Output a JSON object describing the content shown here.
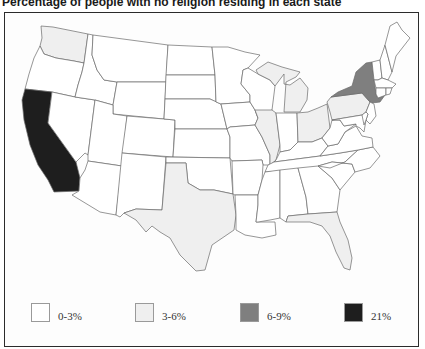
{
  "title": "Percentage of people with no religion residing in each state",
  "colors": {
    "c0": "#ffffff",
    "c1": "#efefef",
    "c2": "#7f7f7f",
    "c3": "#1e1e1e",
    "border": "#6a6a6a",
    "frame": "#2b2b2b"
  },
  "legend": {
    "items": [
      {
        "label": "0-3%",
        "class": "c0",
        "color": "#ffffff",
        "x": 31
      },
      {
        "label": "3-6%",
        "class": "c1",
        "color": "#efefef",
        "x": 135
      },
      {
        "label": "6-9%",
        "class": "c2",
        "color": "#7f7f7f",
        "x": 240
      },
      {
        "label": "21%",
        "class": "c3",
        "color": "#1e1e1e",
        "x": 344
      }
    ]
  },
  "chart_data": {
    "type": "choropleth",
    "title": "Percentage of people with no religion residing in each state",
    "legend_position": "bottom",
    "categories": [
      "0-3%",
      "3-6%",
      "6-9%",
      "21%"
    ],
    "states": {
      "California": "21%",
      "New York": "6-9%",
      "Washington": "3-6%",
      "Texas": "3-6%",
      "Florida": "3-6%",
      "Illinois": "3-6%",
      "Michigan": "3-6%",
      "Ohio": "3-6%",
      "Pennsylvania": "3-6%",
      "Oregon": "0-3%",
      "Nevada": "0-3%",
      "Idaho": "0-3%",
      "Montana": "0-3%",
      "Wyoming": "0-3%",
      "Utah": "0-3%",
      "Arizona": "0-3%",
      "Colorado": "0-3%",
      "New Mexico": "0-3%",
      "North Dakota": "0-3%",
      "South Dakota": "0-3%",
      "Nebraska": "0-3%",
      "Kansas": "0-3%",
      "Oklahoma": "0-3%",
      "Minnesota": "0-3%",
      "Iowa": "0-3%",
      "Missouri": "0-3%",
      "Arkansas": "0-3%",
      "Louisiana": "0-3%",
      "Wisconsin": "0-3%",
      "Indiana": "0-3%",
      "Kentucky": "0-3%",
      "Tennessee": "0-3%",
      "Mississippi": "0-3%",
      "Alabama": "0-3%",
      "Georgia": "0-3%",
      "South Carolina": "0-3%",
      "North Carolina": "0-3%",
      "Virginia": "0-3%",
      "West Virginia": "0-3%",
      "Maryland": "0-3%",
      "Delaware": "0-3%",
      "New Jersey": "0-3%",
      "Connecticut": "0-3%",
      "Rhode Island": "0-3%",
      "Massachusetts": "0-3%",
      "Vermont": "0-3%",
      "New Hampshire": "0-3%",
      "Maine": "0-3%"
    }
  },
  "map": {
    "states": [
      {
        "name": "Washington",
        "fill": "#efefef",
        "points": "41,26 53,27 88,34 84,63 74,61 56,58 44,54 40,46 42,38"
      },
      {
        "name": "Oregon",
        "fill": "#ffffff",
        "points": "40,46 44,54 56,58 74,61 84,63 82,72 78,85 75,97 52,92 25,89 29,74 34,58"
      },
      {
        "name": "California",
        "fill": "#1e1e1e",
        "points": "25,89 52,92 48,123 76,162 80,178 79,191 54,192 48,180 38,165 30,145 24,120 22,100"
      },
      {
        "name": "Nevada",
        "fill": "#ffffff",
        "points": "52,92 75,97 95,100 88,155 85,153 78,160 76,162 48,123"
      },
      {
        "name": "Idaho",
        "fill": "#ffffff",
        "points": "88,34 93,35 92,55 97,70 104,80 117,82 113,105 95,100 75,97 78,85 82,72 84,63"
      },
      {
        "name": "Montana",
        "fill": "#ffffff",
        "points": "93,35 168,45 166,82 117,82 104,80 97,70 92,55"
      },
      {
        "name": "Wyoming",
        "fill": "#ffffff",
        "points": "117,82 166,82 164,119 113,114 113,105"
      },
      {
        "name": "Utah",
        "fill": "#ffffff",
        "points": "95,100 113,105 113,114 127,116 122,166 88,161 88,155"
      },
      {
        "name": "Arizona",
        "fill": "#ffffff",
        "points": "88,161 122,166 116,215 100,212 72,195 79,191 80,178 85,170"
      },
      {
        "name": "Colorado",
        "fill": "#ffffff",
        "points": "127,116 164,119 175,120 173,157 122,153"
      },
      {
        "name": "New Mexico",
        "fill": "#ffffff",
        "points": "122,153 166,157 162,210 136,209 124,213 120,217 116,215"
      },
      {
        "name": "North Dakota",
        "fill": "#ffffff",
        "points": "168,45 212,47 215,75 166,75"
      },
      {
        "name": "South Dakota",
        "fill": "#ffffff",
        "points": "166,75 215,75 216,102 210,99 165,99"
      },
      {
        "name": "Nebraska",
        "fill": "#ffffff",
        "points": "165,99 210,99 221,104 227,129 175,129 175,120 164,119"
      },
      {
        "name": "Kansas",
        "fill": "#ffffff",
        "points": "175,129 227,129 230,137 230,158 173,157"
      },
      {
        "name": "Oklahoma",
        "fill": "#ffffff",
        "points": "166,157 230,158 233,194 214,190 200,190 188,183 186,163 166,163"
      },
      {
        "name": "Texas",
        "fill": "#efefef",
        "points": "166,163 186,163 188,183 200,190 214,190 233,194 236,215 234,230 212,245 205,270 196,271 180,255 170,238 160,232 152,226 146,232 136,220 124,213 136,209 162,210"
      },
      {
        "name": "Minnesota",
        "fill": "#ffffff",
        "points": "212,47 228,47 245,52 260,55 248,68 243,70 241,84 250,95 250,102 221,104 216,102 215,75"
      },
      {
        "name": "Iowa",
        "fill": "#ffffff",
        "points": "221,104 250,102 255,110 258,118 255,125 230,127 227,129"
      },
      {
        "name": "Missouri",
        "fill": "#ffffff",
        "points": "227,129 230,127 255,125 262,137 270,155 270,165 263,165 262,160 232,161 230,158 230,137"
      },
      {
        "name": "Arkansas",
        "fill": "#ffffff",
        "points": "232,161 262,160 263,165 262,180 258,195 235,195 233,194"
      },
      {
        "name": "Louisiana",
        "fill": "#ffffff",
        "points": "235,195 258,195 258,205 256,222 275,222 276,235 262,238 245,235 236,230 236,215"
      },
      {
        "name": "Wisconsin",
        "fill": "#ffffff",
        "points": "243,70 248,68 258,74 270,80 275,86 272,110 258,118 255,110 250,102 250,95 241,84"
      },
      {
        "name": "Illinois",
        "fill": "#efefef",
        "points": "255,110 272,110 276,113 280,145 276,160 270,165 270,155 262,137 255,125 258,118"
      },
      {
        "name": "Michigan",
        "fill": "#efefef",
        "points": "256,70 268,62 282,67 300,72 296,77 286,82 284,112 300,112 307,100 308,88 300,78 290,85 284,84 284,74 275,86 270,80 258,74"
      },
      {
        "name": "Indiana",
        "fill": "#ffffff",
        "points": "276,113 297,113 298,142 290,150 280,152 280,145"
      },
      {
        "name": "Ohio",
        "fill": "#efefef",
        "points": "297,113 308,112 318,108 327,104 330,128 322,138 312,142 298,142"
      },
      {
        "name": "Kentucky",
        "fill": "#ffffff",
        "points": "280,152 290,150 298,142 312,142 322,138 328,146 320,156 274,162 276,160"
      },
      {
        "name": "Tennessee",
        "fill": "#ffffff",
        "points": "274,162 320,156 340,153 358,150 345,162 330,168 265,172 268,165"
      },
      {
        "name": "Mississippi",
        "fill": "#ffffff",
        "points": "265,172 280,170 280,218 270,220 258,222 256,222 258,205 258,195 262,180"
      },
      {
        "name": "Alabama",
        "fill": "#ffffff",
        "points": "280,170 298,168 306,197 308,214 288,216 286,222 280,218"
      },
      {
        "name": "Georgia",
        "fill": "#ffffff",
        "points": "298,168 318,166 332,178 340,190 337,212 308,214 306,197"
      },
      {
        "name": "Florida",
        "fill": "#efefef",
        "points": "286,222 288,216 308,214 337,212 340,222 348,240 352,258 350,270 344,268 336,252 330,236 322,226 310,222 296,222"
      },
      {
        "name": "South Carolina",
        "fill": "#ffffff",
        "points": "318,166 332,162 352,164 355,172 340,190 332,178"
      },
      {
        "name": "North Carolina",
        "fill": "#ffffff",
        "points": "330,168 345,162 358,150 373,147 380,156 370,168 355,172 352,164 332,162 318,166"
      },
      {
        "name": "Virginia",
        "fill": "#ffffff",
        "points": "320,156 328,146 338,144 345,132 356,126 362,136 372,138 373,147 358,150 340,153"
      },
      {
        "name": "West Virginia",
        "fill": "#ffffff",
        "points": "322,138 330,128 332,120 340,120 344,126 356,124 345,132 338,144 328,146"
      },
      {
        "name": "Pennsylvania",
        "fill": "#efefef",
        "points": "327,102 331,97 362,93 370,102 366,112 362,115 332,120 330,112"
      },
      {
        "name": "New York",
        "fill": "#7f7f7f",
        "points": "331,97 338,92 352,86 356,72 366,63 372,62 374,80 376,94 378,98 385,95 380,102 372,103 370,102 362,93"
      },
      {
        "name": "New Jersey",
        "fill": "#ffffff",
        "points": "370,102 374,104 376,116 370,124 366,120 368,114 366,112"
      },
      {
        "name": "Maryland",
        "fill": "#ffffff",
        "points": "332,120 362,115 366,120 364,132 360,128 356,126 356,124 344,126 340,120"
      },
      {
        "name": "Delaware",
        "fill": "#ffffff",
        "points": "362,115 366,112 368,114 366,120 364,125"
      },
      {
        "name": "Vermont",
        "fill": "#ffffff",
        "points": "372,62 380,60 382,78 378,80 374,80"
      },
      {
        "name": "New Hampshire",
        "fill": "#ffffff",
        "points": "380,60 385,45 392,72 388,80 382,78"
      },
      {
        "name": "Maine",
        "fill": "#ffffff",
        "points": "385,45 390,26 397,22 402,30 410,38 396,56 392,72"
      },
      {
        "name": "Massachusetts",
        "fill": "#ffffff",
        "points": "374,80 378,80 382,78 388,80 396,84 392,88 376,88"
      },
      {
        "name": "Connecticut",
        "fill": "#ffffff",
        "points": "376,88 386,88 386,95 378,98 376,94"
      },
      {
        "name": "Rhode Island",
        "fill": "#ffffff",
        "points": "386,88 392,88 390,94 386,95"
      }
    ]
  }
}
